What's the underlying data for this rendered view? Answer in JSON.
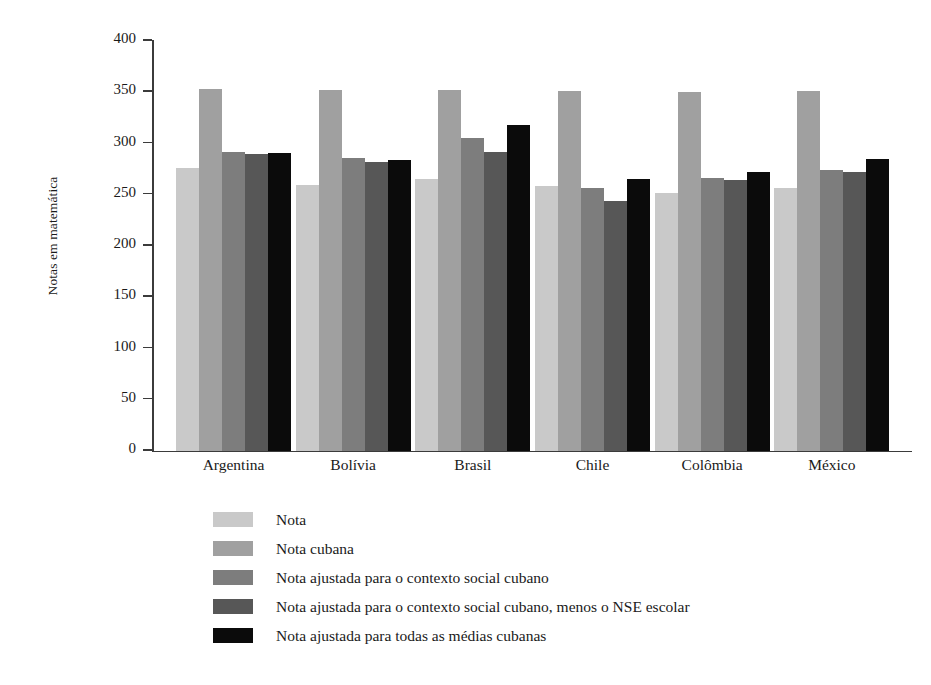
{
  "chart_data": {
    "type": "bar",
    "title": "",
    "subtitle": "",
    "xlabel": "",
    "ylabel": "Notas em matemática",
    "ylim": [
      0,
      400
    ],
    "yticks": [
      0,
      50,
      100,
      150,
      200,
      250,
      300,
      350,
      400
    ],
    "grid": false,
    "legend_position": "below-plot-left",
    "categories": [
      "Argentina",
      "Bolívia",
      "Brasil",
      "Chile",
      "Colômbia",
      "México"
    ],
    "series": [
      {
        "name": "Nota",
        "color": "#c9c9c9",
        "values": [
          276,
          259,
          265,
          258,
          251,
          256
        ]
      },
      {
        "name": "Nota cubana",
        "color": "#a0a0a0",
        "values": [
          353,
          352,
          352,
          351,
          350,
          351
        ]
      },
      {
        "name": "Nota ajustada para o contexto social cubano",
        "color": "#7d7d7d",
        "values": [
          291,
          285,
          305,
          256,
          266,
          274
        ]
      },
      {
        "name": "Nota ajustada para o contexto social cubano, menos o NSE escolar",
        "color": "#575757",
        "values": [
          289,
          281,
          291,
          243,
          264,
          272
        ]
      },
      {
        "name": "Nota ajustada para todas as médias cubanas",
        "color": "#0b0b0b",
        "values": [
          290,
          283,
          318,
          265,
          272,
          284
        ]
      }
    ]
  }
}
